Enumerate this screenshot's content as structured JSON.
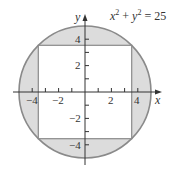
{
  "diagram": {
    "equation": {
      "x": "x",
      "sup1": "2",
      "plus": " + ",
      "y": "y",
      "sup2": "2",
      "rest": " = 25"
    },
    "axes": {
      "x_label": "x",
      "y_label": "y"
    },
    "x_ticks": [
      "−4",
      "−2",
      "2",
      "4"
    ],
    "y_ticks": [
      "4",
      "2",
      "−2",
      "−4"
    ],
    "circle_radius": 5,
    "square_half_side": 3.54,
    "colors": {
      "shade": "#dcdcdc",
      "circle_stroke": "#8a8a8a",
      "square_stroke": "#8a8a8a",
      "axis": "#333333"
    }
  }
}
